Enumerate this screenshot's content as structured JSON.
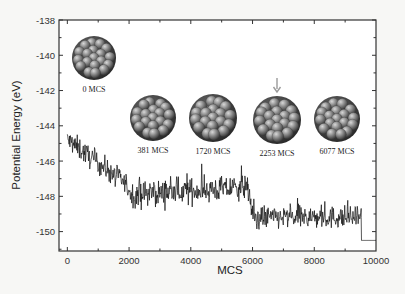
{
  "chart_data": {
    "type": "line",
    "title": "",
    "xlabel": "MCS",
    "ylabel": "Potential Energy (eV)",
    "xlim": [
      -270,
      10000
    ],
    "ylim": [
      -151.1,
      -138
    ],
    "xticks": [
      0,
      2000,
      4000,
      6000,
      8000,
      10000
    ],
    "xtick_labels": [
      "0",
      "2000",
      "4000",
      "6000",
      "8000",
      "10000"
    ],
    "yticks": [
      -138,
      -140,
      -142,
      -144,
      -146,
      -148,
      -150
    ],
    "ytick_labels": [
      "-138",
      "-140",
      "-142",
      "-144",
      "-146",
      "-148",
      "-150"
    ],
    "grid": false,
    "legend": null,
    "series": [
      {
        "name": "Potential Energy",
        "color": "#111111",
        "description": "Noisy Monte Carlo energy trace with stepwise drops",
        "segments": [
          {
            "x_start": 0,
            "x_end": 1900,
            "y_start": -144.8,
            "y_end": -147.3,
            "noise": 0.45
          },
          {
            "x_start": 1900,
            "x_end": 2100,
            "y_start": -147.3,
            "y_end": -148.0,
            "noise": 0.45
          },
          {
            "x_start": 2100,
            "x_end": 5850,
            "y_start": -147.9,
            "y_end": -147.5,
            "noise": 0.5
          },
          {
            "x_start": 5850,
            "x_end": 6000,
            "y_start": -147.6,
            "y_end": -149.0,
            "noise": 0.4
          },
          {
            "x_start": 6000,
            "x_end": 9520,
            "y_start": -149.2,
            "y_end": -149.2,
            "noise": 0.45
          },
          {
            "x_start": 9520,
            "x_end": 9530,
            "y_start": -149.2,
            "y_end": -150.5,
            "noise": 0
          },
          {
            "x_start": 9530,
            "x_end": 10000,
            "y_start": -150.5,
            "y_end": -150.5,
            "noise": 0
          }
        ],
        "key_points": [
          {
            "x": 0,
            "y": -144.7
          },
          {
            "x": 1000,
            "y": -146.0
          },
          {
            "x": 1900,
            "y": -147.4
          },
          {
            "x": 4000,
            "y": -147.8
          },
          {
            "x": 5850,
            "y": -147.5
          },
          {
            "x": 6000,
            "y": -149.1
          },
          {
            "x": 8000,
            "y": -149.2
          },
          {
            "x": 9500,
            "y": -149.2
          },
          {
            "x": 9530,
            "y": -150.5
          },
          {
            "x": 10000,
            "y": -150.5
          }
        ]
      }
    ],
    "annotations": [
      {
        "type": "cluster-image",
        "label": "0 MCS",
        "cx": 94,
        "cy": 58,
        "r": 22
      },
      {
        "type": "cluster-image",
        "label": "381 MCS",
        "cx": 153,
        "cy": 118,
        "r": 23
      },
      {
        "type": "cluster-image",
        "label": "1720 MCS",
        "cx": 213,
        "cy": 118,
        "r": 24
      },
      {
        "type": "cluster-image",
        "label": "2253 MCS",
        "cx": 277,
        "cy": 120,
        "r": 24,
        "arrow": true
      },
      {
        "type": "cluster-image",
        "label": "6077 MCS",
        "cx": 337,
        "cy": 119,
        "r": 23
      }
    ]
  },
  "axes": {
    "frame_color": "#333333",
    "arrow_color": "#9a9a9a"
  }
}
